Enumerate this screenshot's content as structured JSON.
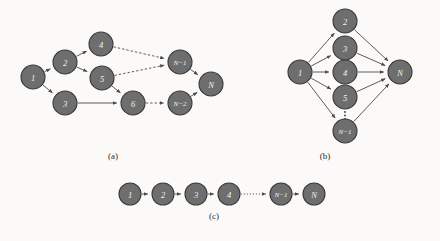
{
  "figure": {
    "background": "#fbfaf8",
    "node_fill": "#6e6e6e",
    "node_stroke": "#3a3a3a",
    "label_color": "#f2f2f2",
    "edge_color": "#4a4a4a"
  },
  "panels": [
    {
      "id": "a",
      "caption": "(a)",
      "caption_pos": {
        "x": 113,
        "y": 156
      },
      "nodes": [
        {
          "id": "n1",
          "label": "1",
          "x": 33,
          "y": 77,
          "r": 12
        },
        {
          "id": "n2",
          "label": "2",
          "x": 65,
          "y": 62,
          "r": 12
        },
        {
          "id": "n3",
          "label": "3",
          "x": 65,
          "y": 103,
          "r": 12
        },
        {
          "id": "n4",
          "label": "4",
          "x": 101,
          "y": 44,
          "r": 12
        },
        {
          "id": "n5",
          "label": "5",
          "x": 102,
          "y": 78,
          "r": 12
        },
        {
          "id": "n6",
          "label": "6",
          "x": 133,
          "y": 103,
          "r": 12
        },
        {
          "id": "nm1",
          "label": "N−1",
          "x": 180,
          "y": 62,
          "r": 12,
          "small": true
        },
        {
          "id": "nm2",
          "label": "N−2",
          "x": 180,
          "y": 103,
          "r": 12,
          "small": true
        },
        {
          "id": "nN",
          "label": "N",
          "x": 211,
          "y": 84,
          "r": 12
        }
      ],
      "edges": [
        {
          "from": "n1",
          "to": "n2",
          "style": "solid"
        },
        {
          "from": "n1",
          "to": "n3",
          "style": "solid"
        },
        {
          "from": "n2",
          "to": "n4",
          "style": "solid"
        },
        {
          "from": "n2",
          "to": "n5",
          "style": "solid"
        },
        {
          "from": "n4",
          "to": "nm1",
          "style": "dashed"
        },
        {
          "from": "n5",
          "to": "nm1",
          "style": "dashed"
        },
        {
          "from": "n5",
          "to": "n6",
          "style": "solid"
        },
        {
          "from": "n3",
          "to": "n6",
          "style": "solid"
        },
        {
          "from": "n6",
          "to": "nm2",
          "style": "dashed"
        },
        {
          "from": "nm1",
          "to": "nN",
          "style": "solid"
        },
        {
          "from": "nm2",
          "to": "nN",
          "style": "solid"
        }
      ]
    },
    {
      "id": "b",
      "caption": "(b)",
      "caption_pos": {
        "x": 325,
        "y": 156
      },
      "nodes": [
        {
          "id": "b1",
          "label": "1",
          "x": 300,
          "y": 72,
          "r": 12
        },
        {
          "id": "b2",
          "label": "2",
          "x": 345,
          "y": 21,
          "r": 12
        },
        {
          "id": "b3",
          "label": "3",
          "x": 345,
          "y": 48,
          "r": 12
        },
        {
          "id": "b4",
          "label": "4",
          "x": 345,
          "y": 72,
          "r": 12
        },
        {
          "id": "b5",
          "label": "5",
          "x": 345,
          "y": 97,
          "r": 12
        },
        {
          "id": "bm1",
          "label": "N−1",
          "x": 345,
          "y": 131,
          "r": 12,
          "small": true
        },
        {
          "id": "bN",
          "label": "N",
          "x": 400,
          "y": 72,
          "r": 12
        }
      ],
      "edges": [
        {
          "from": "b1",
          "to": "b2",
          "style": "solid"
        },
        {
          "from": "b1",
          "to": "b3",
          "style": "solid"
        },
        {
          "from": "b1",
          "to": "b4",
          "style": "solid"
        },
        {
          "from": "b1",
          "to": "b5",
          "style": "solid"
        },
        {
          "from": "b1",
          "to": "bm1",
          "style": "solid"
        },
        {
          "from": "b2",
          "to": "bN",
          "style": "solid"
        },
        {
          "from": "b3",
          "to": "bN",
          "style": "solid"
        },
        {
          "from": "b4",
          "to": "bN",
          "style": "solid"
        },
        {
          "from": "b5",
          "to": "bN",
          "style": "solid"
        },
        {
          "from": "bm1",
          "to": "bN",
          "style": "solid"
        }
      ],
      "ellipsis": {
        "x": 345,
        "y_from": 112,
        "y_to": 119,
        "orientation": "vertical"
      }
    },
    {
      "id": "c",
      "caption": "(c)",
      "caption_pos": {
        "x": 214,
        "y": 216
      },
      "nodes": [
        {
          "id": "c1",
          "label": "1",
          "x": 130,
          "y": 194,
          "r": 11
        },
        {
          "id": "c2",
          "label": "2",
          "x": 163,
          "y": 194,
          "r": 11
        },
        {
          "id": "c3",
          "label": "3",
          "x": 196,
          "y": 194,
          "r": 11
        },
        {
          "id": "c4",
          "label": "4",
          "x": 229,
          "y": 194,
          "r": 11
        },
        {
          "id": "cm1",
          "label": "N−1",
          "x": 281,
          "y": 194,
          "r": 11,
          "small": true
        },
        {
          "id": "cN",
          "label": "N",
          "x": 314,
          "y": 194,
          "r": 11
        }
      ],
      "edges": [
        {
          "from": "c1",
          "to": "c2",
          "style": "solid"
        },
        {
          "from": "c2",
          "to": "c3",
          "style": "solid"
        },
        {
          "from": "c3",
          "to": "c4",
          "style": "solid"
        },
        {
          "from": "c4",
          "to": "cm1",
          "style": "dotted"
        },
        {
          "from": "cm1",
          "to": "cN",
          "style": "solid"
        }
      ]
    }
  ]
}
